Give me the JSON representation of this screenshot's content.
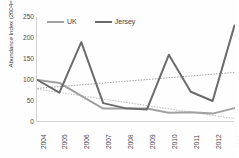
{
  "chart_data": {
    "type": "line",
    "title": "",
    "xlabel": "",
    "ylabel": "Abundance Index (2004=100)",
    "categories": [
      "2004",
      "2005",
      "2006",
      "2007",
      "2008",
      "2009",
      "2010",
      "2011",
      "2012",
      "2013"
    ],
    "series": [
      {
        "name": "UK",
        "color": "#a0a0a0",
        "values": [
          100,
          93,
          62,
          32,
          32,
          32,
          22,
          23,
          20,
          33
        ]
      },
      {
        "name": "Jersey",
        "color": "#6b6b6b",
        "values": [
          100,
          70,
          190,
          45,
          33,
          30,
          160,
          72,
          50,
          230
        ]
      }
    ],
    "trendlines": [
      {
        "name": "UK trend",
        "style": "dotted",
        "color": "#b8b8b8",
        "start": 78,
        "end": 8
      },
      {
        "name": "Jersey trend",
        "style": "dotted",
        "color": "#9a9a9a",
        "start": 80,
        "end": 118
      }
    ],
    "ylim": [
      0,
      250
    ],
    "yticks": [
      250,
      200,
      150,
      100,
      50,
      0
    ],
    "grid": false,
    "legend_position": "top"
  },
  "legend": {
    "items": [
      {
        "label": "UK"
      },
      {
        "label": "Jersey"
      }
    ]
  },
  "axis": {
    "y_title": "Abundance Index (2004=100)"
  }
}
